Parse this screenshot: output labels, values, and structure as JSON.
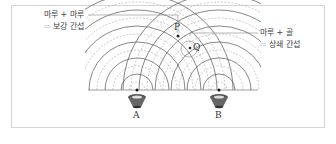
{
  "labels": {
    "left_line1": "마루 + 마루",
    "left_arrow": "⇨",
    "left_line2": "보강 간섭",
    "right_line1": "마루 + 골",
    "right_arrow": "⇨",
    "right_line2": "상쇄 간섭"
  },
  "points": {
    "p": "P",
    "q": "Q"
  },
  "sources": {
    "a": "A",
    "b": "B"
  },
  "colors": {
    "crest": "#555555",
    "trough": "#999999",
    "arrow": "#a9c8d8",
    "frame": "#d4d4d4"
  }
}
